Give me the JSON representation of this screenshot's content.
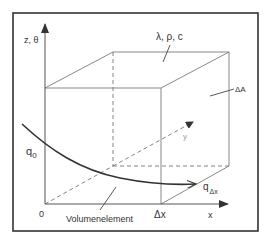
{
  "diagram": {
    "type": "3d-volume-element-heat-conduction",
    "labels": {
      "z_axis": "z, θ",
      "properties": "λ, ρ, c",
      "area": "ΔA",
      "flux_in": "q",
      "flux_in_sub": "0",
      "flux_out": "q",
      "flux_out_sub": "Δx",
      "origin": "0",
      "volume_element": "Volumenelement",
      "delta_x": "Δx",
      "x_axis": "x",
      "y_axis": "y"
    },
    "colors": {
      "frame": "#333333",
      "edges": "#7a7a7a",
      "text": "#333333",
      "y_label": "#999999"
    }
  }
}
